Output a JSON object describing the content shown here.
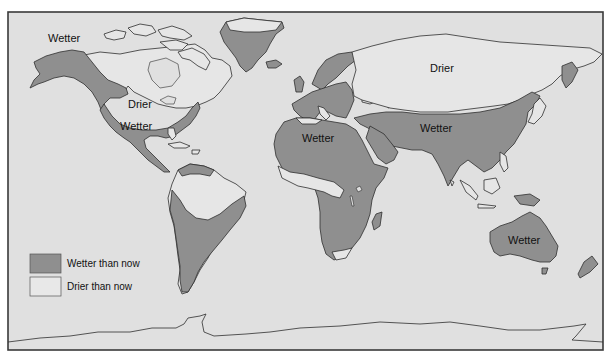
{
  "map": {
    "title": "",
    "region_labels": [
      {
        "id": "alaska",
        "text": "Wetter",
        "category": "wetter"
      },
      {
        "id": "north-america",
        "text": "Drier",
        "category": "drier"
      },
      {
        "id": "central-america",
        "text": "Wetter",
        "category": "wetter"
      },
      {
        "id": "north-africa",
        "text": "Wetter",
        "category": "wetter"
      },
      {
        "id": "south-asia",
        "text": "Wetter",
        "category": "wetter"
      },
      {
        "id": "siberia",
        "text": "Drier",
        "category": "drier"
      },
      {
        "id": "australia",
        "text": "Wetter",
        "category": "wetter"
      }
    ],
    "legend": {
      "items": [
        {
          "label": "Wetter than now",
          "color": "#8f8f8f"
        },
        {
          "label": "Drier than now",
          "color": "#e8e8e8"
        }
      ]
    },
    "colors": {
      "ocean": "#e0e0e0",
      "wetter": "#8f8f8f",
      "drier": "#e6e6e6",
      "outline": "#2e2e2e"
    }
  }
}
